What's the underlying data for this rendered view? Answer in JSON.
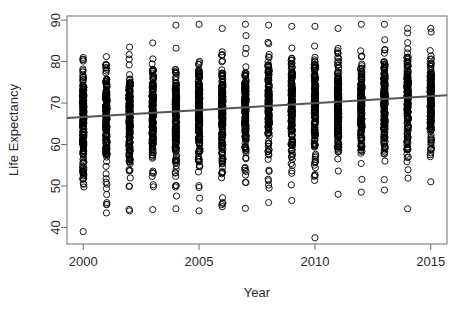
{
  "chart_data": {
    "type": "scatter",
    "title": "",
    "xlabel": "Year",
    "ylabel": "Life Expectancy",
    "xlim": [
      1999.3,
      2015.7
    ],
    "ylim": [
      36.0,
      91.0
    ],
    "grid": false,
    "legend": false,
    "xticks": [
      2000,
      2005,
      2010,
      2015
    ],
    "xtick_labels": [
      "2000",
      "2005",
      "2010",
      "2015"
    ],
    "yticks": [
      40,
      50,
      60,
      70,
      80,
      90
    ],
    "ytick_labels": [
      "40",
      "50",
      "60",
      "70",
      "80",
      "90"
    ],
    "marker": "open-circle",
    "marker_color": "#000000",
    "marker_size": 3.1,
    "point_count_per_year": 183,
    "series": [
      {
        "name": "Life expectancy by country",
        "x": [
          2000,
          2001,
          2002,
          2003,
          2004,
          2005,
          2006,
          2007,
          2008,
          2009,
          2010,
          2011,
          2012,
          2013,
          2014,
          2015
        ],
        "y_summary": [
          {
            "year": 2000,
            "min": 39.0,
            "q1": 58.5,
            "median": 67.0,
            "q3": 73.5,
            "max": 81.0
          },
          {
            "year": 2001,
            "min": 43.5,
            "q1": 58.8,
            "median": 67.2,
            "q3": 73.7,
            "max": 81.2
          },
          {
            "year": 2002,
            "min": 44.0,
            "q1": 59.0,
            "median": 67.4,
            "q3": 74.0,
            "max": 83.5
          },
          {
            "year": 2003,
            "min": 44.3,
            "q1": 59.3,
            "median": 67.6,
            "q3": 74.2,
            "max": 84.5
          },
          {
            "year": 2004,
            "min": 44.5,
            "q1": 59.8,
            "median": 68.0,
            "q3": 74.5,
            "max": 88.8
          },
          {
            "year": 2005,
            "min": 44.0,
            "q1": 60.2,
            "median": 68.3,
            "q3": 74.8,
            "max": 89.0
          },
          {
            "year": 2006,
            "min": 45.0,
            "q1": 60.6,
            "median": 68.6,
            "q3": 75.0,
            "max": 88.0
          },
          {
            "year": 2007,
            "min": 44.6,
            "q1": 61.0,
            "median": 69.0,
            "q3": 75.3,
            "max": 89.0
          },
          {
            "year": 2008,
            "min": 46.0,
            "q1": 61.5,
            "median": 69.3,
            "q3": 75.6,
            "max": 88.8
          },
          {
            "year": 2009,
            "min": 46.5,
            "q1": 62.0,
            "median": 69.7,
            "q3": 75.8,
            "max": 88.5
          },
          {
            "year": 2010,
            "min": 37.5,
            "q1": 62.4,
            "median": 70.0,
            "q3": 76.0,
            "max": 88.5
          },
          {
            "year": 2011,
            "min": 48.0,
            "q1": 62.8,
            "median": 70.3,
            "q3": 76.3,
            "max": 88.0
          },
          {
            "year": 2012,
            "min": 48.5,
            "q1": 63.2,
            "median": 70.6,
            "q3": 76.5,
            "max": 89.0
          },
          {
            "year": 2013,
            "min": 49.0,
            "q1": 63.6,
            "median": 70.9,
            "q3": 76.8,
            "max": 89.0
          },
          {
            "year": 2014,
            "min": 44.5,
            "q1": 64.0,
            "median": 71.2,
            "q3": 77.0,
            "max": 88.0
          },
          {
            "year": 2015,
            "min": 51.0,
            "q1": 64.4,
            "median": 71.5,
            "q3": 77.2,
            "max": 88.0
          }
        ]
      }
    ],
    "trend_line": {
      "name": "linear fit",
      "color": "#555555",
      "width": 2,
      "x_start": 1999.3,
      "y_start": 66.4,
      "x_end": 2015.7,
      "y_end": 71.9,
      "slope": 0.335,
      "intercept": -603.7
    }
  }
}
